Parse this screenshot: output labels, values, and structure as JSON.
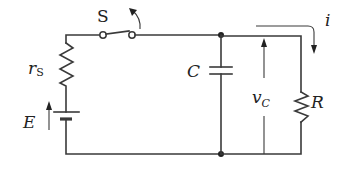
{
  "diagram": {
    "type": "circuit",
    "title": "",
    "labels": {
      "switch": "S",
      "source_resistance": "r",
      "source_resistance_sub": "S",
      "emf": "E",
      "capacitor": "C",
      "capacitor_voltage": "v",
      "capacitor_voltage_sub": "C",
      "load_resistor": "R",
      "current": "i"
    },
    "components": [
      {
        "id": "S",
        "kind": "switch",
        "state": "open-arrow (closing/opening)"
      },
      {
        "id": "rS",
        "kind": "resistor"
      },
      {
        "id": "E",
        "kind": "dc-source"
      },
      {
        "id": "C",
        "kind": "capacitor"
      },
      {
        "id": "R",
        "kind": "resistor"
      }
    ],
    "annotations": [
      {
        "kind": "voltage-arrow",
        "label": "vC",
        "across": "C"
      },
      {
        "kind": "current-arrow",
        "label": "i",
        "through": "R"
      },
      {
        "kind": "voltage-arrow",
        "label": "E",
        "across": "source"
      }
    ],
    "colors": {
      "line": "#3a3a3a",
      "text": "#222222",
      "background": "#ffffff"
    }
  }
}
